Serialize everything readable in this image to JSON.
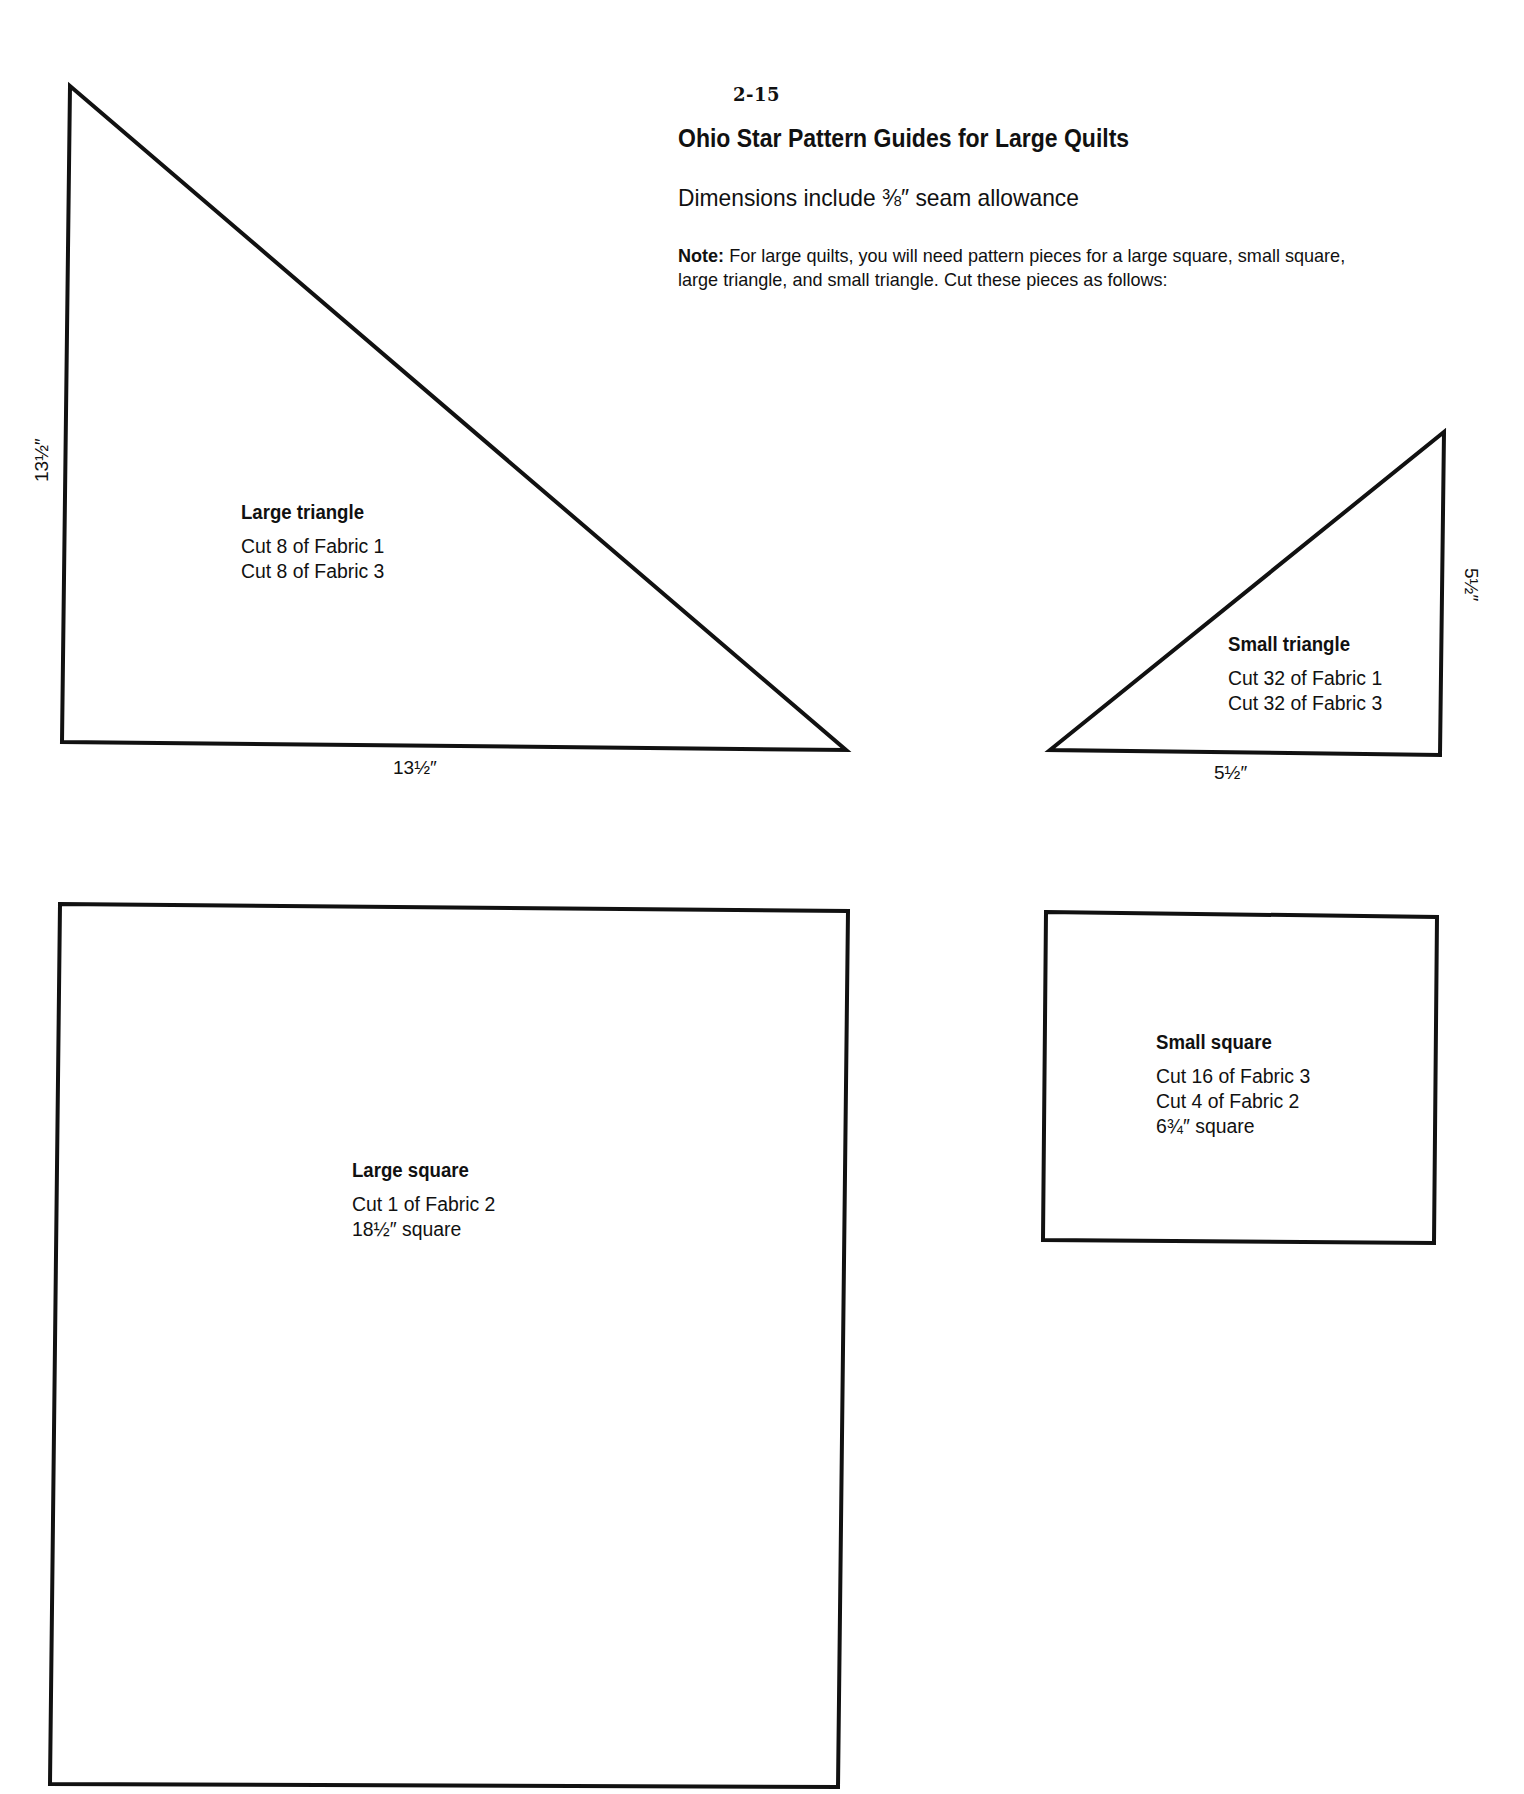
{
  "page": {
    "number": "2-15",
    "title": "Ohio Star Pattern Guides for Large Quilts",
    "subtitle": "Dimensions include ⅜″ seam allowance",
    "note_label": "Note:",
    "note_line1": " For large quilts, you will need pattern pieces for a large square, small square,",
    "note_line2": "large triangle, and small triangle. Cut these pieces as follows:"
  },
  "pieces": {
    "large_triangle": {
      "title": "Large triangle",
      "lines": [
        "Cut 8 of Fabric 1",
        "Cut 8 of Fabric 3"
      ],
      "dim_vertical": "13½″",
      "dim_horizontal": "13½″"
    },
    "small_triangle": {
      "title": "Small triangle",
      "lines": [
        "Cut 32 of Fabric 1",
        "Cut 32 of Fabric 3"
      ],
      "dim_vertical": "5½″",
      "dim_horizontal": "5½″"
    },
    "large_square": {
      "title": "Large square",
      "lines": [
        "Cut 1 of Fabric 2",
        "18½″ square"
      ]
    },
    "small_square": {
      "title": "Small square",
      "lines": [
        "Cut 16 of Fabric 3",
        "Cut 4 of Fabric 2",
        "6¾″ square"
      ]
    }
  },
  "colors": {
    "ink": "#111111",
    "paper": "#ffffff"
  }
}
